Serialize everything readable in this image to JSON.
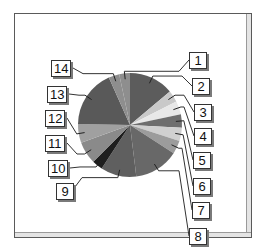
{
  "chart_data": {
    "type": "pie",
    "title": "",
    "start_angle_deg": -12,
    "direction": "clockwise",
    "center": [
      130,
      125
    ],
    "radius": 52,
    "categories": [
      "1",
      "2",
      "3",
      "4",
      "5",
      "6",
      "7",
      "8",
      "9",
      "10",
      "11",
      "12",
      "13",
      "14"
    ],
    "values": [
      3.3,
      13.9,
      3.6,
      4.2,
      4.2,
      4.2,
      4.2,
      13.9,
      11.1,
      3.3,
      6.9,
      5.8,
      18.1,
      3.3
    ],
    "angles_deg": [
      12,
      50,
      13,
      15,
      15,
      15,
      15,
      50,
      40,
      12,
      25,
      21,
      65,
      12
    ],
    "colors": [
      "#8e8e8e",
      "#5c5c5c",
      "#c9c9c9",
      "#e8e8e8",
      "#6e6e6e",
      "#d0d0d0",
      "#9c9c9c",
      "#686868",
      "#5f5f5f",
      "#1e1e1e",
      "#8a8a8a",
      "#a0a0a0",
      "#595959",
      "#8e8e8e"
    ],
    "legend": "callout labels",
    "grid": false
  },
  "labels": [
    {
      "text": "1",
      "x": 189,
      "y": 52
    },
    {
      "text": "2",
      "x": 192,
      "y": 78
    },
    {
      "text": "3",
      "x": 194,
      "y": 104
    },
    {
      "text": "4",
      "x": 194,
      "y": 128
    },
    {
      "text": "5",
      "x": 193,
      "y": 152
    },
    {
      "text": "6",
      "x": 193,
      "y": 178
    },
    {
      "text": "7",
      "x": 192,
      "y": 202
    },
    {
      "text": "8",
      "x": 189,
      "y": 228
    },
    {
      "text": "9",
      "x": 56,
      "y": 183
    },
    {
      "text": "10",
      "x": 48,
      "y": 160
    },
    {
      "text": "11",
      "x": 45,
      "y": 135
    },
    {
      "text": "12",
      "x": 45,
      "y": 110
    },
    {
      "text": "13",
      "x": 47,
      "y": 86
    },
    {
      "text": "14",
      "x": 51,
      "y": 60
    }
  ]
}
